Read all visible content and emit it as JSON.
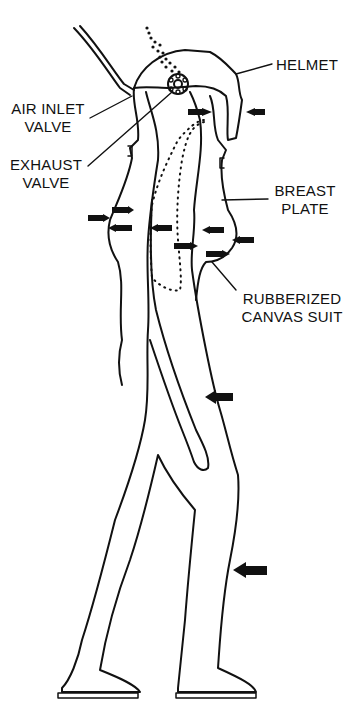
{
  "diagram": {
    "labels": {
      "helmet": "HELMET",
      "air_inlet_valve_1": "AIR INLET",
      "air_inlet_valve_2": "VALVE",
      "exhaust_valve_1": "EXHAUST",
      "exhaust_valve_2": "VALVE",
      "breast_plate_1": "BREAST",
      "breast_plate_2": "PLATE",
      "suit_1": "RUBBERIZED",
      "suit_2": "CANVAS SUIT"
    },
    "pressure_arrows_count": 13,
    "colors": {
      "line": "#111111",
      "background": "#ffffff"
    }
  }
}
